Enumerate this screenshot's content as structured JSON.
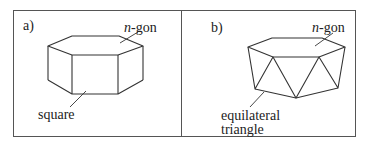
{
  "panels": [
    {
      "id": "a",
      "label": "a)",
      "annotations": {
        "top_face": "n-gon",
        "side_face": "square"
      },
      "shape": "prism"
    },
    {
      "id": "b",
      "label": "b)",
      "annotations": {
        "top_face": "n-gon",
        "side_face_line1": "equilateral",
        "side_face_line2": "triangle"
      },
      "shape": "antiprism"
    }
  ],
  "n_prefix": "n",
  "gon_suffix": "-gon"
}
